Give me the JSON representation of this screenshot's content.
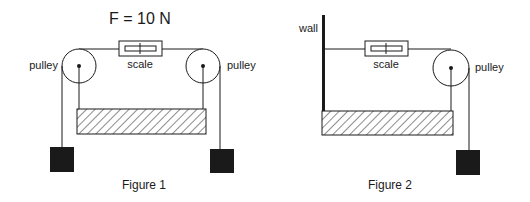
{
  "figure1": {
    "force_label": "F = 10 N",
    "scale_label": "scale",
    "left_pulley_label": "pulley",
    "right_pulley_label": "pulley",
    "caption": "Figure 1"
  },
  "figure2": {
    "wall_label": "wall",
    "scale_label": "scale",
    "pulley_label": "pulley",
    "caption": "Figure 2"
  },
  "colors": {
    "ink": "#1a1a1a",
    "background": "#ffffff"
  }
}
